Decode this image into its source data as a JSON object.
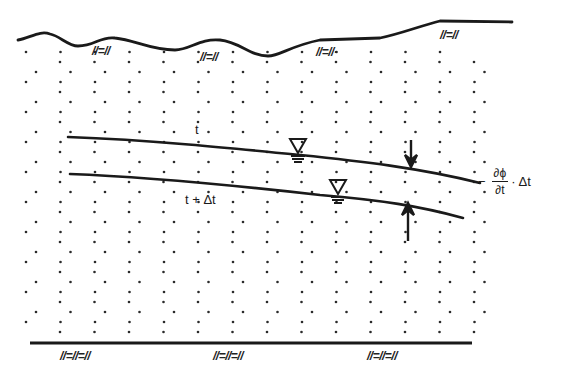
{
  "diagram": {
    "type": "groundwater-table-decline-cross-section",
    "colors": {
      "line": "#1a1a1a",
      "dots": "#2a2a2a",
      "background": "#ffffff"
    },
    "surface_hatch_marks": [
      "//=//",
      "//=//",
      "//=//·",
      "//=//"
    ],
    "base_hatch_marks": [
      "//=//=//",
      "//=//=//",
      "//=//=//"
    ],
    "labels": {
      "water_table_t": "t",
      "water_table_t_dt": "t + Δt",
      "formula_minus": "−",
      "formula_numerator": "∂ϕ",
      "formula_denominator": "∂t",
      "formula_suffix": "· Δt"
    },
    "symbols": {
      "water_table_marker": "inverted-triangle-with-hatch",
      "drawdown_arrows": "converging-vertical-arrows"
    }
  }
}
